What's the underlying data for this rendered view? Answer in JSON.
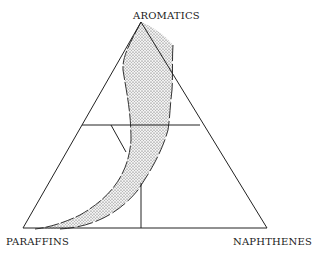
{
  "diagram": {
    "type": "ternary",
    "vertices": {
      "top": "AROMATICS",
      "bottom_left": "PARAFFINS",
      "bottom_right": "NAPHTHENES"
    },
    "shaded_region": "curved band from aromatics apex to paraffins corner",
    "colors": {
      "line": "#222222",
      "fill_dots": "#555555",
      "background": "#ffffff"
    }
  }
}
